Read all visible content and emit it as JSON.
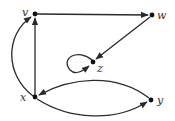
{
  "diagram": {
    "type": "directed-graph",
    "nodes": [
      {
        "id": "v",
        "label": "v",
        "x": 35,
        "y": 14
      },
      {
        "id": "w",
        "label": "w",
        "x": 152,
        "y": 15
      },
      {
        "id": "z",
        "label": "z",
        "x": 93,
        "y": 62
      },
      {
        "id": "x",
        "label": "x",
        "x": 35,
        "y": 97
      },
      {
        "id": "y",
        "label": "y",
        "x": 151,
        "y": 100
      }
    ],
    "edges": [
      {
        "from": "v",
        "to": "w",
        "shape": "straight"
      },
      {
        "from": "w",
        "to": "z",
        "shape": "straight"
      },
      {
        "from": "x",
        "to": "v",
        "shape": "straight"
      },
      {
        "from": "x",
        "to": "v",
        "shape": "curved-left"
      },
      {
        "from": "z",
        "to": "z",
        "shape": "self-loop"
      },
      {
        "from": "y",
        "to": "x",
        "shape": "curved-above"
      },
      {
        "from": "x",
        "to": "y",
        "shape": "curved-below"
      }
    ],
    "colors": {
      "edge": "#2a2a2a",
      "node": "#111111",
      "label": "#333333"
    }
  }
}
